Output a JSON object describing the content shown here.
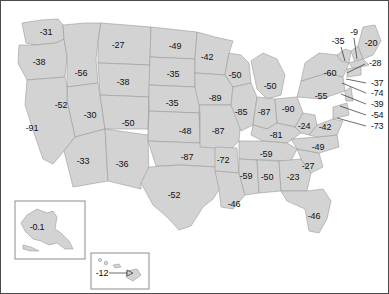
{
  "figure": {
    "type": "choropleth-map",
    "region": "United States",
    "colors": {
      "state_fill": "#d3d3d3",
      "state_border": "#9a9a9a",
      "frame_border": "#4a4a4a",
      "background": "#ffffff",
      "label_text": "#111111",
      "leader_line": "#2b2b2b"
    }
  },
  "chart_data": {
    "type": "map",
    "title": "",
    "xlabel": "",
    "ylabel": "",
    "grid": false,
    "legend": "none",
    "categories": [
      "WA",
      "OR",
      "ID",
      "MT",
      "WY",
      "NV",
      "UT",
      "CO",
      "AZ",
      "NM",
      "ND",
      "SD",
      "NE",
      "KS",
      "OK",
      "TX",
      "MN",
      "IA",
      "MO",
      "AR",
      "LA",
      "WI",
      "IL",
      "MI",
      "IN",
      "OH",
      "KY",
      "TN",
      "MS",
      "AL",
      "GA",
      "FL",
      "SC",
      "NC",
      "VA",
      "WV",
      "PA",
      "NY",
      "VT",
      "NH",
      "ME",
      "MA",
      "RI",
      "CT",
      "NJ",
      "DE",
      "MD",
      "DC",
      "AK",
      "HI",
      "MN2"
    ],
    "values": [
      -31,
      -38,
      -56,
      -27,
      -38,
      -52,
      -30,
      -50,
      -33,
      -36,
      -49,
      -35,
      -35,
      -48,
      -87,
      -52,
      -42,
      -89,
      -85,
      -72,
      -46,
      -50,
      -87,
      -50,
      -90,
      -55,
      -81,
      -59,
      -59,
      -50,
      -23,
      -46,
      -27,
      -49,
      -42,
      -24,
      -60,
      -35,
      -9,
      -20,
      -28,
      -37,
      -74,
      -39,
      -54,
      -73,
      -46,
      -59,
      -0.1,
      -12,
      -42
    ]
  },
  "labels": {
    "mainland": [
      {
        "name": "washington",
        "value": "-31",
        "x": 45,
        "y": 31
      },
      {
        "name": "oregon",
        "value": "-38",
        "x": 38,
        "y": 61
      },
      {
        "name": "idaho",
        "value": "-56",
        "x": 80,
        "y": 72
      },
      {
        "name": "montana",
        "value": "-27",
        "x": 117,
        "y": 44
      },
      {
        "name": "wyoming",
        "value": "-38",
        "x": 122,
        "y": 81
      },
      {
        "name": "nevada",
        "value": "-52",
        "x": 60,
        "y": 104
      },
      {
        "name": "utah",
        "value": "-30",
        "x": 89,
        "y": 114
      },
      {
        "name": "colorado",
        "value": "-50",
        "x": 127,
        "y": 122
      },
      {
        "name": "california",
        "value": "-91",
        "x": 31,
        "y": 127
      },
      {
        "name": "arizona",
        "value": "-33",
        "x": 82,
        "y": 160
      },
      {
        "name": "new-mexico",
        "value": "-36",
        "x": 121,
        "y": 163
      },
      {
        "name": "north-dakota",
        "value": "-49",
        "x": 174,
        "y": 45
      },
      {
        "name": "south-dakota",
        "value": "-35",
        "x": 172,
        "y": 73
      },
      {
        "name": "nebraska",
        "value": "-35",
        "x": 171,
        "y": 102
      },
      {
        "name": "kansas",
        "value": "-48",
        "x": 184,
        "y": 130
      },
      {
        "name": "oklahoma",
        "value": "-87",
        "x": 186,
        "y": 156
      },
      {
        "name": "texas",
        "value": "-52",
        "x": 173,
        "y": 194
      },
      {
        "name": "minnesota",
        "value": "-42",
        "x": 206,
        "y": 56
      },
      {
        "name": "iowa",
        "value": "-89",
        "x": 214,
        "y": 97
      },
      {
        "name": "missouri",
        "value": "-87",
        "x": 217,
        "y": 130
      },
      {
        "name": "arkansas",
        "value": "-72",
        "x": 222,
        "y": 159
      },
      {
        "name": "louisiana",
        "value": "-46",
        "x": 233,
        "y": 203
      },
      {
        "name": "wisconsin",
        "value": "-50",
        "x": 234,
        "y": 74
      },
      {
        "name": "illinois",
        "value": "-85",
        "x": 240,
        "y": 111
      },
      {
        "name": "michigan",
        "value": "-50",
        "x": 269,
        "y": 85
      },
      {
        "name": "indiana",
        "value": "-87",
        "x": 263,
        "y": 111
      },
      {
        "name": "ohio",
        "value": "-90",
        "x": 287,
        "y": 108
      },
      {
        "name": "kentucky",
        "value": "-81",
        "x": 275,
        "y": 134
      },
      {
        "name": "tennessee",
        "value": "-59",
        "x": 265,
        "y": 153
      },
      {
        "name": "mississippi",
        "value": "-59",
        "x": 245,
        "y": 175
      },
      {
        "name": "alabama",
        "value": "-50",
        "x": 266,
        "y": 176
      },
      {
        "name": "georgia",
        "value": "-23",
        "x": 292,
        "y": 176
      },
      {
        "name": "florida",
        "value": "-46",
        "x": 313,
        "y": 215
      },
      {
        "name": "south-carolina",
        "value": "-27",
        "x": 307,
        "y": 165
      },
      {
        "name": "north-carolina",
        "value": "-49",
        "x": 317,
        "y": 146
      },
      {
        "name": "west-virginia",
        "value": "-24",
        "x": 303,
        "y": 125
      },
      {
        "name": "virginia",
        "value": "-42",
        "x": 324,
        "y": 126
      },
      {
        "name": "pennsylvania",
        "value": "-60",
        "x": 329,
        "y": 72
      },
      {
        "name": "new-york",
        "value": "-55",
        "x": 320,
        "y": 95
      },
      {
        "name": "vermont",
        "value": "-35",
        "x": 337,
        "y": 40
      },
      {
        "name": "new-hampshire",
        "value": "-9",
        "x": 353,
        "y": 31
      },
      {
        "name": "maine",
        "value": "-20",
        "x": 370,
        "y": 42
      }
    ],
    "callouts": [
      {
        "name": "massachusetts",
        "value": "-28",
        "x": 368,
        "y": 62,
        "lx1": 364,
        "ly1": 63,
        "lx2": 346,
        "ly2": 72
      },
      {
        "name": "rhode-island",
        "value": "-37",
        "x": 370,
        "y": 82,
        "lx1": 365,
        "ly1": 82,
        "lx2": 345,
        "ly2": 78
      },
      {
        "name": "connecticut",
        "value": "-74",
        "x": 370,
        "y": 92,
        "lx1": 365,
        "ly1": 92,
        "lx2": 341,
        "ly2": 82
      },
      {
        "name": "new-jersey",
        "value": "-39",
        "x": 370,
        "y": 103,
        "lx1": 365,
        "ly1": 103,
        "lx2": 340,
        "ly2": 93
      },
      {
        "name": "delaware",
        "value": "-54",
        "x": 370,
        "y": 114,
        "lx1": 365,
        "ly1": 114,
        "lx2": 339,
        "ly2": 105
      },
      {
        "name": "maryland",
        "value": "-73",
        "x": 370,
        "y": 125,
        "lx1": 365,
        "ly1": 125,
        "lx2": 336,
        "ly2": 117
      }
    ],
    "insets": [
      {
        "name": "alaska",
        "value": "-0.1",
        "x": 36,
        "y": 226
      },
      {
        "name": "hawaii",
        "value": "-12",
        "x": 101,
        "y": 272
      }
    ]
  }
}
